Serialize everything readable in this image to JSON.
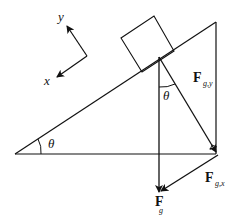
{
  "diagram": {
    "colors": {
      "stroke": "#111111",
      "background": "#ffffff"
    },
    "axes": {
      "x_label": "x",
      "y_label": "y"
    },
    "angle_labels": {
      "incline_angle": "θ",
      "force_angle": "θ"
    },
    "forces": {
      "gravity": {
        "main": "F",
        "sub": "g"
      },
      "gravity_y": {
        "main": "F",
        "sub": "g,y"
      },
      "gravity_x": {
        "main": "F",
        "sub": "g,x"
      }
    }
  }
}
